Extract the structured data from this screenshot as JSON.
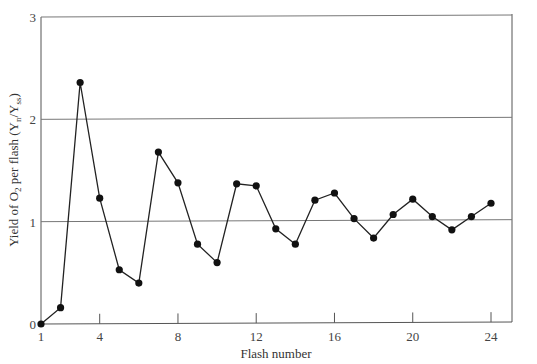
{
  "chart_data": {
    "type": "line",
    "title": "",
    "xlabel": "Flash number",
    "ylabel": "Yield of O2 per flash (Yn/Yss)",
    "ylabel_parts": {
      "prefix": "Yield of O",
      "o2_sub": "2",
      "middle": " per flash (Y",
      "n_sub": "n",
      "slash": "/Y",
      "ss_sub": "ss",
      "suffix": ")"
    },
    "x": [
      1,
      2,
      3,
      4,
      5,
      6,
      7,
      8,
      9,
      10,
      11,
      12,
      13,
      14,
      15,
      16,
      17,
      18,
      19,
      20,
      21,
      22,
      23,
      24
    ],
    "values": [
      0.0,
      0.16,
      2.36,
      1.23,
      0.53,
      0.4,
      1.68,
      1.38,
      0.78,
      0.6,
      1.37,
      1.35,
      0.93,
      0.78,
      1.21,
      1.28,
      1.03,
      0.84,
      1.07,
      1.22,
      1.05,
      0.92,
      1.05,
      1.18
    ],
    "xlim": [
      1,
      25
    ],
    "ylim": [
      0,
      3
    ],
    "x_ticks": [
      "1",
      "4",
      "8",
      "12",
      "16",
      "20",
      "24"
    ],
    "y_ticks": [
      "0",
      "1",
      "2",
      "3"
    ],
    "grid": "horizontal at y=1, y=2, y=3",
    "legend": "none",
    "marker": "filled circle",
    "line_color": "#222222"
  }
}
